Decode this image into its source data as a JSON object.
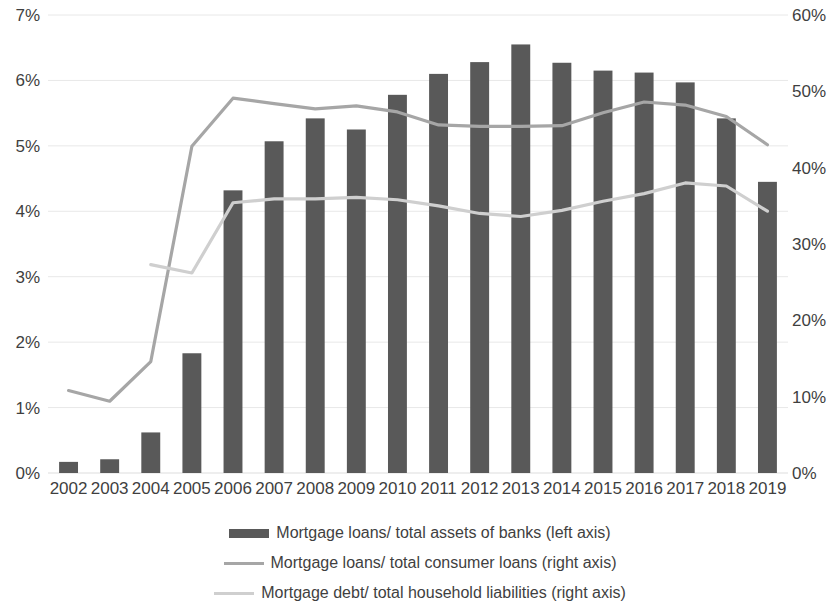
{
  "chart_data": {
    "type": "bar",
    "title": "",
    "subtitle": "",
    "xlabel": "",
    "ylabel": "",
    "grid": true,
    "legend_position": "bottom",
    "categories": [
      "2002",
      "2003",
      "2004",
      "2005",
      "2006",
      "2007",
      "2008",
      "2009",
      "2010",
      "2011",
      "2012",
      "2013",
      "2014",
      "2015",
      "2016",
      "2017",
      "2018",
      "2019"
    ],
    "axes": {
      "left": {
        "ylim": [
          0,
          7
        ],
        "ticks": [
          0,
          1,
          2,
          3,
          4,
          5,
          6,
          7
        ],
        "tick_labels": [
          "0%",
          "1%",
          "2%",
          "3%",
          "4%",
          "5%",
          "6%",
          "7%"
        ]
      },
      "right": {
        "ylim": [
          0,
          60
        ],
        "ticks": [
          0,
          10,
          20,
          30,
          40,
          50,
          60
        ],
        "tick_labels": [
          "0%",
          "10%",
          "20%",
          "30%",
          "40%",
          "50%",
          "60%"
        ]
      }
    },
    "series": [
      {
        "name": "Mortgage loans/ total assets of banks (left axis)",
        "type": "bar",
        "axis": "left",
        "color": "#595959",
        "values": [
          0.17,
          0.21,
          0.62,
          1.83,
          4.32,
          5.07,
          5.42,
          5.25,
          5.78,
          6.1,
          6.28,
          6.55,
          6.27,
          6.15,
          6.12,
          5.97,
          5.42,
          4.45
        ]
      },
      {
        "name": "Mortgage loans/ total consumer loans (right axis)",
        "type": "line",
        "axis": "right",
        "color": "#a6a6a6",
        "values": [
          10.8,
          9.4,
          14.6,
          42.8,
          49.1,
          48.4,
          47.7,
          48.1,
          47.3,
          45.6,
          45.4,
          45.4,
          45.5,
          47.2,
          48.6,
          48.2,
          46.7,
          43.0
        ]
      },
      {
        "name": "Mortgage debt/ total household liabilities (right axis)",
        "type": "line",
        "axis": "right",
        "color": "#cfcfcf",
        "values": [
          null,
          null,
          27.3,
          26.2,
          35.4,
          35.9,
          35.9,
          36.1,
          35.8,
          35.0,
          34.0,
          33.6,
          34.4,
          35.6,
          36.6,
          38.0,
          37.6,
          34.3
        ]
      }
    ]
  },
  "legend": {
    "items": [
      {
        "label": "Mortgage loans/ total assets of banks (left axis)",
        "marker": "bar-swatch",
        "color": "#595959"
      },
      {
        "label": "Mortgage loans/ total consumer loans (right axis)",
        "marker": "line-swatch",
        "color": "#a6a6a6"
      },
      {
        "label": "Mortgage debt/ total household liabilities (right axis)",
        "marker": "line-swatch",
        "color": "#cfcfcf"
      }
    ]
  },
  "style": {
    "gridline_color": "#e8e8e8",
    "background": "#ffffff",
    "text_color": "#3f3f3f"
  }
}
